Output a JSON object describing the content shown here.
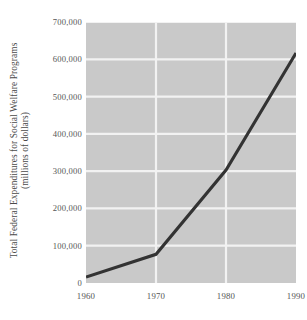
{
  "chart_data": {
    "type": "line",
    "title": "",
    "xlabel": "",
    "ylabel_line1": "Total Federal Expenditures for Social Welfare Programs",
    "ylabel_line2": "(millions of dollars)",
    "x": [
      1960,
      1970,
      1980,
      1990
    ],
    "xtick_labels": [
      "1960",
      "1970",
      "1980",
      "1990"
    ],
    "values": [
      16000,
      77000,
      303000,
      617000
    ],
    "series": [
      {
        "name": "Total Federal Expenditures for Social Welfare Programs",
        "values": [
          16000,
          77000,
          303000,
          617000
        ]
      }
    ],
    "ytick_labels": [
      "0",
      "100,000",
      "200,000",
      "300,000",
      "400,000",
      "500,000",
      "600,000",
      "700,000"
    ],
    "ytick_values": [
      0,
      100000,
      200000,
      300000,
      400000,
      500000,
      600000,
      700000
    ],
    "xlim": [
      1960,
      1990
    ],
    "ylim": [
      0,
      700000
    ],
    "grid": true,
    "legend": "none",
    "colors": {
      "plot_background": "#c9c9c9",
      "gridline": "#f2f2f2",
      "line": "#333333",
      "text": "#555555",
      "figure_background": "#ffffff"
    }
  }
}
